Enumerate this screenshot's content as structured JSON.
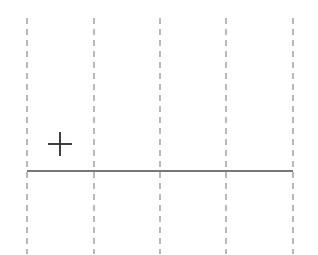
{
  "diagram": {
    "width": 318,
    "height": 255,
    "background": "#ffffff",
    "gridlines": {
      "orientation": "vertical",
      "style": "dashed",
      "color": "#8a8a8a",
      "stroke_width": 1.2,
      "dash": "6 5",
      "y_start": 18,
      "y_end": 254,
      "x_positions": [
        27,
        94,
        160,
        226,
        293
      ]
    },
    "baseline": {
      "style": "solid",
      "color": "#4a4a4a",
      "stroke_width": 1.6,
      "x_start": 27,
      "x_end": 293,
      "y": 171
    },
    "marker": {
      "icon": "plus-icon",
      "symbol": "+",
      "color": "#2a2a2a",
      "center_x": 60,
      "center_y": 144,
      "size": 24,
      "stroke_width": 1.8
    }
  }
}
